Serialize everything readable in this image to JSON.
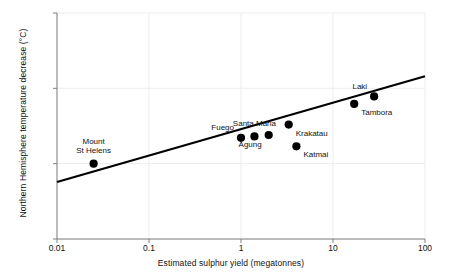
{
  "chart_data": {
    "type": "scatter",
    "title": "",
    "xlabel": "Estimated sulphur yield (megatonnes)",
    "ylabel": "Northern Hemisphere temperature decrease (°C)",
    "xscale": "log",
    "yscale": "log",
    "xlim": [
      0.01,
      100
    ],
    "ylim": [
      0.01,
      10
    ],
    "xticks": [
      "0.01",
      "0.1",
      "1",
      "10",
      "100"
    ],
    "xtick_values": [
      0.01,
      0.1,
      1,
      10,
      100
    ],
    "yticks": [
      "10",
      "1",
      "0.1",
      "0.01"
    ],
    "ytick_values": [
      10,
      1,
      0.1,
      0.01
    ],
    "grid": "faint decade gridlines",
    "legend": "none",
    "marker_color": "#000000",
    "line_color": "#000000",
    "points": [
      {
        "name": "Mount St Helens",
        "x": 0.025,
        "y": 0.1,
        "label": "Mount\nSt Helens",
        "label_pos": "above"
      },
      {
        "name": "Fuego",
        "x": 1.0,
        "y": 0.22,
        "label": "Fuego",
        "label_pos": "above-left"
      },
      {
        "name": "Santa Maria",
        "x": 1.4,
        "y": 0.23,
        "label": "Santa Maria",
        "label_pos": "above"
      },
      {
        "name": "Agung",
        "x": 2.0,
        "y": 0.24,
        "label": "Agung",
        "label_pos": "below-left"
      },
      {
        "name": "Krakatau",
        "x": 3.3,
        "y": 0.33,
        "label": "Krakatau",
        "label_pos": "below-right"
      },
      {
        "name": "Katmai",
        "x": 4.0,
        "y": 0.17,
        "label": "Katmai",
        "label_pos": "below-right"
      },
      {
        "name": "Tambora",
        "x": 17.0,
        "y": 0.62,
        "label": "Tambora",
        "label_pos": "below-right"
      },
      {
        "name": "Laki",
        "x": 28.0,
        "y": 0.78,
        "label": "Laki",
        "label_pos": "above-left"
      }
    ],
    "trendline": {
      "description": "linear regression fit in log-log space",
      "x_start": 0.01,
      "y_start": 0.057,
      "x_end": 100,
      "y_end": 1.45
    }
  },
  "figure": {
    "background_color": "#ffffff",
    "frame_color": "#808080",
    "grid_color": "#ededf0",
    "text_color": "#111111"
  }
}
